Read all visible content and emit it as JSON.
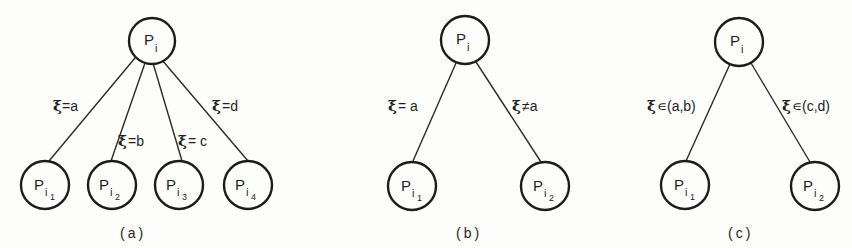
{
  "figure": {
    "background": "#fdfdfc",
    "ink": "#1e1e1e",
    "panels": [
      {
        "id": "a",
        "caption": "(a)",
        "root": {
          "base": "P",
          "sub": "i"
        },
        "children": [
          {
            "base": "P",
            "sub": "i",
            "subsub": "1"
          },
          {
            "base": "P",
            "sub": "i",
            "subsub": "2"
          },
          {
            "base": "P",
            "sub": "i",
            "subsub": "3"
          },
          {
            "base": "P",
            "sub": "i",
            "subsub": "4"
          }
        ],
        "edge_labels": [
          {
            "sym": "ξ",
            "text": "=a"
          },
          {
            "sym": "ξ",
            "text": "=b"
          },
          {
            "sym": "ξ",
            "text": "= c"
          },
          {
            "sym": "ξ",
            "text": "=d"
          }
        ]
      },
      {
        "id": "b",
        "caption": "(b)",
        "root": {
          "base": "P",
          "sub": "i"
        },
        "children": [
          {
            "base": "P",
            "sub": "i",
            "subsub": "1"
          },
          {
            "base": "P",
            "sub": "i",
            "subsub": "2"
          }
        ],
        "edge_labels": [
          {
            "sym": "ξ",
            "text": "= a"
          },
          {
            "sym": "ξ",
            "text": "≠a"
          }
        ]
      },
      {
        "id": "c",
        "caption": "(c)",
        "root": {
          "base": "P",
          "sub": "i"
        },
        "children": [
          {
            "base": "P",
            "sub": "i",
            "subsub": "1"
          },
          {
            "base": "P",
            "sub": "i",
            "subsub": "2"
          }
        ],
        "edge_labels": [
          {
            "sym": "ξ",
            "text": "∊(a,b)"
          },
          {
            "sym": "ξ",
            "text": "∊(c,d)"
          }
        ]
      }
    ]
  }
}
